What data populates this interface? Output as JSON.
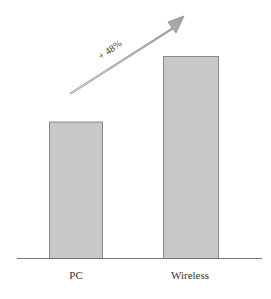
{
  "chart_data": {
    "type": "bar",
    "title": "",
    "xlabel": "",
    "ylabel": "",
    "categories": [
      "PC",
      "Wireless"
    ],
    "values": [
      100,
      148
    ],
    "ylim": [
      0,
      165
    ],
    "grid": false,
    "legend": null,
    "annotations": [
      {
        "type": "arrow",
        "text": "+ 48%",
        "from": "PC",
        "to": "Wireless",
        "direction": "up-right"
      }
    ],
    "colors": {
      "bar_fill": "#c8c8c8",
      "bar_stroke": "#8a8a8a",
      "axis": "#777777",
      "arrow": "#9a9a9a"
    }
  },
  "labels": {
    "cat0": "PC",
    "cat1": "Wireless",
    "growth": "+ 48%"
  }
}
